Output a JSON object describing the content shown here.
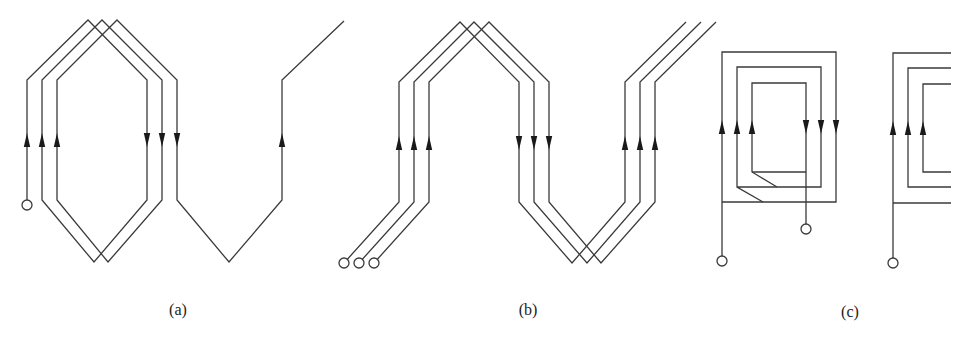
{
  "figure": {
    "colors": {
      "line": "#3a3a3a",
      "arrow": "#1a1a1a",
      "background": "#ffffff"
    },
    "panels": [
      {
        "id": "a",
        "label": "(a)",
        "label_pos": [
          178,
          315
        ],
        "type": "lap-winding"
      },
      {
        "id": "b",
        "label": "(b)",
        "label_pos": [
          528,
          315
        ],
        "type": "wave-winding"
      },
      {
        "id": "c",
        "label": "(c)",
        "label_pos": [
          850,
          317
        ],
        "type": "concentric-coil"
      }
    ],
    "wires": [
      {
        "panel": "a",
        "points": [
          [
            27,
            200
          ],
          [
            27,
            80
          ],
          [
            88,
            20
          ],
          [
            147,
            80
          ],
          [
            147,
            200
          ],
          [
            94,
            262
          ],
          [
            42,
            200
          ],
          [
            42,
            80
          ],
          [
            102,
            20
          ],
          [
            162,
            80
          ],
          [
            162,
            200
          ],
          [
            108,
            262
          ],
          [
            57,
            200
          ],
          [
            57,
            80
          ],
          [
            117,
            20
          ],
          [
            177,
            80
          ],
          [
            177,
            200
          ],
          [
            229,
            262
          ],
          [
            282,
            200
          ],
          [
            282,
            80
          ],
          [
            344,
            21
          ]
        ]
      },
      {
        "panel": "b",
        "points": [
          [
            344,
            263
          ],
          [
            399,
            202
          ],
          [
            399,
            82
          ],
          [
            460,
            22
          ],
          [
            519,
            82
          ],
          [
            519,
            202
          ],
          [
            572,
            263
          ],
          [
            625,
            202
          ],
          [
            625,
            82
          ],
          [
            686,
            22
          ]
        ]
      },
      {
        "panel": "b",
        "points": [
          [
            359,
            263
          ],
          [
            414,
            202
          ],
          [
            414,
            82
          ],
          [
            474,
            22
          ],
          [
            534,
            82
          ],
          [
            534,
            202
          ],
          [
            587,
            263
          ],
          [
            640,
            202
          ],
          [
            640,
            82
          ],
          [
            701,
            22
          ]
        ]
      },
      {
        "panel": "b",
        "points": [
          [
            374,
            263
          ],
          [
            429,
            202
          ],
          [
            429,
            82
          ],
          [
            489,
            22
          ],
          [
            549,
            82
          ],
          [
            549,
            202
          ],
          [
            601,
            263
          ],
          [
            655,
            202
          ],
          [
            655,
            82
          ],
          [
            716,
            22
          ]
        ]
      },
      {
        "panel": "c",
        "points": [
          [
            722,
            256
          ],
          [
            722,
            52
          ],
          [
            836,
            52
          ],
          [
            836,
            202
          ],
          [
            722,
            202
          ]
        ]
      },
      {
        "panel": "c",
        "points": [
          [
            763,
            202
          ],
          [
            737,
            187
          ],
          [
            737,
            67
          ],
          [
            821,
            67
          ],
          [
            821,
            187
          ],
          [
            737,
            187
          ]
        ]
      },
      {
        "panel": "c",
        "points": [
          [
            777,
            187
          ],
          [
            752,
            172
          ],
          [
            752,
            83
          ],
          [
            806,
            83
          ],
          [
            806,
            224
          ]
        ]
      },
      {
        "panel": "c",
        "points": [
          [
            752,
            172
          ],
          [
            806,
            172
          ]
        ]
      },
      {
        "panel": "c2",
        "points": [
          [
            893,
            258
          ],
          [
            893,
            53
          ],
          [
            951,
            53
          ]
        ]
      },
      {
        "panel": "c2",
        "points": [
          [
            893,
            203
          ],
          [
            951,
            203
          ]
        ]
      },
      {
        "panel": "c2",
        "points": [
          [
            951,
            68
          ],
          [
            908,
            68
          ],
          [
            908,
            187
          ],
          [
            951,
            187
          ]
        ]
      },
      {
        "panel": "c2",
        "points": [
          [
            951,
            84
          ],
          [
            923,
            84
          ],
          [
            923,
            172
          ],
          [
            951,
            172
          ]
        ]
      }
    ],
    "terminals": [
      {
        "panel": "a",
        "cx": 27,
        "cy": 205,
        "r": 5
      },
      {
        "panel": "b",
        "cx": 344,
        "cy": 263,
        "r": 5
      },
      {
        "panel": "b",
        "cx": 359,
        "cy": 263,
        "r": 5
      },
      {
        "panel": "b",
        "cx": 374,
        "cy": 263,
        "r": 5
      },
      {
        "panel": "c",
        "cx": 722,
        "cy": 261,
        "r": 5
      },
      {
        "panel": "c",
        "cx": 806,
        "cy": 229,
        "r": 5
      },
      {
        "panel": "c2",
        "cx": 893,
        "cy": 263,
        "r": 5
      }
    ],
    "arrows": [
      {
        "x": 27,
        "y": 140,
        "dir": "up"
      },
      {
        "x": 42,
        "y": 140,
        "dir": "up"
      },
      {
        "x": 57,
        "y": 140,
        "dir": "up"
      },
      {
        "x": 147,
        "y": 140,
        "dir": "down"
      },
      {
        "x": 162,
        "y": 140,
        "dir": "down"
      },
      {
        "x": 177,
        "y": 140,
        "dir": "down"
      },
      {
        "x": 282,
        "y": 140,
        "dir": "up"
      },
      {
        "x": 399,
        "y": 143,
        "dir": "up"
      },
      {
        "x": 414,
        "y": 143,
        "dir": "up"
      },
      {
        "x": 429,
        "y": 143,
        "dir": "up"
      },
      {
        "x": 519,
        "y": 143,
        "dir": "down"
      },
      {
        "x": 534,
        "y": 143,
        "dir": "down"
      },
      {
        "x": 549,
        "y": 143,
        "dir": "down"
      },
      {
        "x": 625,
        "y": 143,
        "dir": "up"
      },
      {
        "x": 640,
        "y": 143,
        "dir": "up"
      },
      {
        "x": 655,
        "y": 143,
        "dir": "up"
      },
      {
        "x": 722,
        "y": 127,
        "dir": "up"
      },
      {
        "x": 737,
        "y": 127,
        "dir": "up"
      },
      {
        "x": 752,
        "y": 127,
        "dir": "up"
      },
      {
        "x": 806,
        "y": 127,
        "dir": "down"
      },
      {
        "x": 821,
        "y": 127,
        "dir": "down"
      },
      {
        "x": 836,
        "y": 127,
        "dir": "down"
      },
      {
        "x": 893,
        "y": 128,
        "dir": "up"
      },
      {
        "x": 908,
        "y": 128,
        "dir": "up"
      },
      {
        "x": 923,
        "y": 128,
        "dir": "up"
      }
    ]
  }
}
